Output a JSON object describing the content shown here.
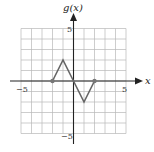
{
  "chart_data": {
    "type": "line",
    "title": "",
    "xlabel": "x",
    "ylabel": "g(x)",
    "xlim": [
      -5,
      5
    ],
    "ylim": [
      -5,
      5
    ],
    "grid": true,
    "x_tick_labels": [
      "-5",
      "5"
    ],
    "y_tick_labels": [
      "5",
      "-5"
    ],
    "series": [
      {
        "name": "g(x)",
        "x": [
          -2,
          -1,
          0,
          1,
          2
        ],
        "y": [
          0,
          2,
          0,
          -2,
          0
        ],
        "endpoint_markers": [
          [
            -2,
            0
          ],
          [
            2,
            0
          ]
        ]
      }
    ]
  },
  "labels": {
    "y_axis": "g(x)",
    "x_axis": "x",
    "x_neg": "−5",
    "x_pos": "5",
    "y_pos": "5",
    "y_neg": "−5"
  }
}
